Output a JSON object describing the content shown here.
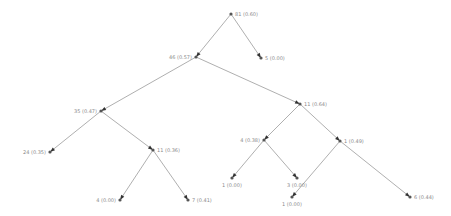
{
  "diagram": {
    "type": "decision-tree",
    "nodes": [
      {
        "id": "n0",
        "label": "81 (0.60)",
        "children": [
          "n1",
          "n2"
        ]
      },
      {
        "id": "n1",
        "label": "46 (0.57)",
        "children": [
          "n3",
          "n4"
        ]
      },
      {
        "id": "n2",
        "label": "5 (0.00)",
        "children": []
      },
      {
        "id": "n3",
        "label": "35 (0.47)",
        "children": [
          "n5",
          "n6"
        ]
      },
      {
        "id": "n4",
        "label": "11 (0.64)",
        "children": [
          "n7",
          "n8"
        ]
      },
      {
        "id": "n5",
        "label": "24 (0.35)",
        "children": []
      },
      {
        "id": "n6",
        "label": "11 (0.36)",
        "children": [
          "n9",
          "n10"
        ]
      },
      {
        "id": "n7",
        "label": "4 (0.38)",
        "children": [
          "n11",
          "n12"
        ]
      },
      {
        "id": "n8",
        "label": "1 (0.49)",
        "children": [
          "n13",
          "n14"
        ]
      },
      {
        "id": "n9",
        "label": "4 (0.00)",
        "children": []
      },
      {
        "id": "n10",
        "label": "7 (0.41)",
        "children": []
      },
      {
        "id": "n11",
        "label": "1 (0.00)",
        "children": []
      },
      {
        "id": "n12",
        "label": "3 (0.00)",
        "children": []
      },
      {
        "id": "n13",
        "label": "1 (0.00)",
        "children": []
      },
      {
        "id": "n14",
        "label": "6 (0.44)",
        "children": []
      }
    ]
  }
}
